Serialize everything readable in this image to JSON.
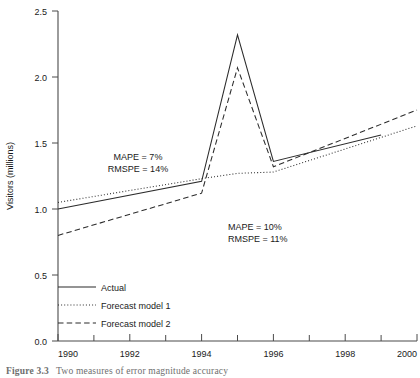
{
  "chart_data": {
    "type": "line",
    "title": "",
    "xlabel": "",
    "ylabel": "Visitors (millions)",
    "xlim": [
      1990,
      2000
    ],
    "ylim": [
      0.0,
      2.5
    ],
    "grid": false,
    "legend_position": "lower-left",
    "y_ticks": [
      "0.0",
      "0.5",
      "1.0",
      "1.5",
      "2.0",
      "2.5"
    ],
    "y_tick_values": [
      0.0,
      0.5,
      1.0,
      1.5,
      2.0,
      2.5
    ],
    "x_ticks": [
      "1990",
      "1992",
      "1994",
      "1996",
      "1998",
      "2000"
    ],
    "x_tick_values": [
      1990,
      1992,
      1994,
      1996,
      1998,
      2000
    ],
    "x_minor_tick_values": [
      1991,
      1993,
      1995,
      1997,
      1999
    ],
    "series": [
      {
        "name": "Actual",
        "style": "solid",
        "x": [
          1990,
          1994,
          1995,
          1996,
          1999
        ],
        "values": [
          1.0,
          1.21,
          2.32,
          1.36,
          1.56
        ]
      },
      {
        "name": "Forecast model 1",
        "style": "dotted",
        "x": [
          1990,
          1994,
          1995,
          1996,
          2000
        ],
        "values": [
          1.05,
          1.23,
          1.27,
          1.28,
          1.63
        ]
      },
      {
        "name": "Forecast model 2",
        "style": "dashed",
        "x": [
          1990,
          1994,
          1995,
          1996,
          2000
        ],
        "values": [
          0.8,
          1.12,
          2.07,
          1.32,
          1.75
        ]
      }
    ],
    "annotations": [
      {
        "id": "upper-left",
        "lines": [
          "MAPE = 7%",
          "RMSPE = 14%"
        ],
        "x": 1993.0,
        "y": 1.37
      },
      {
        "id": "lower-right",
        "lines": [
          "MAPE = 10%",
          "RMSPE = 11%"
        ],
        "x": 1996.6,
        "y": 0.93
      }
    ]
  },
  "legend": {
    "items": [
      {
        "label": "Actual",
        "style": "solid"
      },
      {
        "label": "Forecast model 1",
        "style": "dotted"
      },
      {
        "label": "Forecast model 2",
        "style": "dashed"
      }
    ]
  },
  "caption": {
    "number": "Figure 3.3",
    "text": "Two measures of error magnitude accuracy"
  }
}
